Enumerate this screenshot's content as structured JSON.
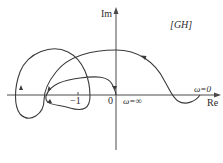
{
  "diagram": {
    "type": "nyquist-plot",
    "axes": {
      "imag_label": "Im",
      "real_label": "Re"
    },
    "function_label": "[GH]",
    "ticks": {
      "minus_one": "−1",
      "origin": "0"
    },
    "annotations": {
      "omega_zero": "ω=0",
      "omega_infinity": "ω=∞"
    },
    "colors": {
      "curve": "#3a3a3a",
      "axes": "#4a4a4a",
      "text": "#2a2a2a",
      "background": "#ffffff"
    }
  }
}
